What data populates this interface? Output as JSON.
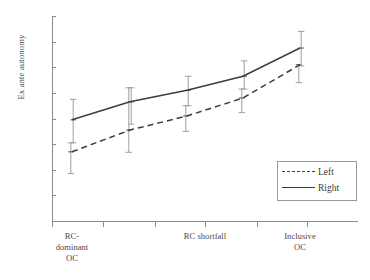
{
  "chart_data": {
    "type": "line",
    "title": "",
    "subtitle": "",
    "xlabel": "",
    "ylabel": "Ex ante autonomy",
    "ylim": [
      0,
      0.8
    ],
    "ytick_labels": [
      "0.8",
      "0.7",
      "0.6",
      "0.5",
      "0.4",
      "0.3",
      "0.2",
      "0.1",
      "0"
    ],
    "ytick_values": [
      0.8,
      0.7,
      0.6,
      0.5,
      0.4,
      0.3,
      0.2,
      0.1,
      0.0
    ],
    "grid": false,
    "legend_position": "lower-right",
    "x_axis_tick_count": 6,
    "x_category_labels": [
      "RC-\ndominant\nOC",
      "RC shortfall",
      "Inclusive\nOC"
    ],
    "x": [
      1,
      2,
      3,
      4,
      5
    ],
    "series": [
      {
        "name": "Left",
        "style": "dashed",
        "color": "#3d3d3d",
        "values": [
          0.27,
          0.355,
          0.41,
          0.48,
          0.61
        ],
        "error_low": [
          0.185,
          0.268,
          0.35,
          0.423,
          0.54
        ],
        "error_high": [
          0.305,
          0.52,
          0.45,
          0.515,
          0.61
        ]
      },
      {
        "name": "Right",
        "style": "solid",
        "color": "#3d3d3d",
        "values": [
          0.395,
          0.465,
          0.51,
          0.565,
          0.675
        ],
        "error_low": [
          0.305,
          0.378,
          0.45,
          0.515,
          0.605
        ],
        "error_high": [
          0.475,
          0.52,
          0.565,
          0.625,
          0.74
        ]
      }
    ]
  },
  "legend": {
    "items": [
      {
        "label": "Left",
        "style": "dashed"
      },
      {
        "label": "Right",
        "style": "solid"
      }
    ]
  },
  "axis": {
    "y_label": "Ex ante autonomy",
    "y_ticks": [
      "0.8",
      "0.7",
      "0.6",
      "0.5",
      "0.4",
      "0.3",
      "0.2",
      "0.1",
      "0"
    ],
    "x_labels": [
      "RC-\ndominant\nOC",
      "RC shortfall",
      "Inclusive\nOC"
    ]
  },
  "colors": {
    "line": "#3d3d3d",
    "axis": "#8a8a8a",
    "errorbar": "#9f9f9f",
    "text": "#4a4a4a",
    "background": "#ffffff"
  }
}
